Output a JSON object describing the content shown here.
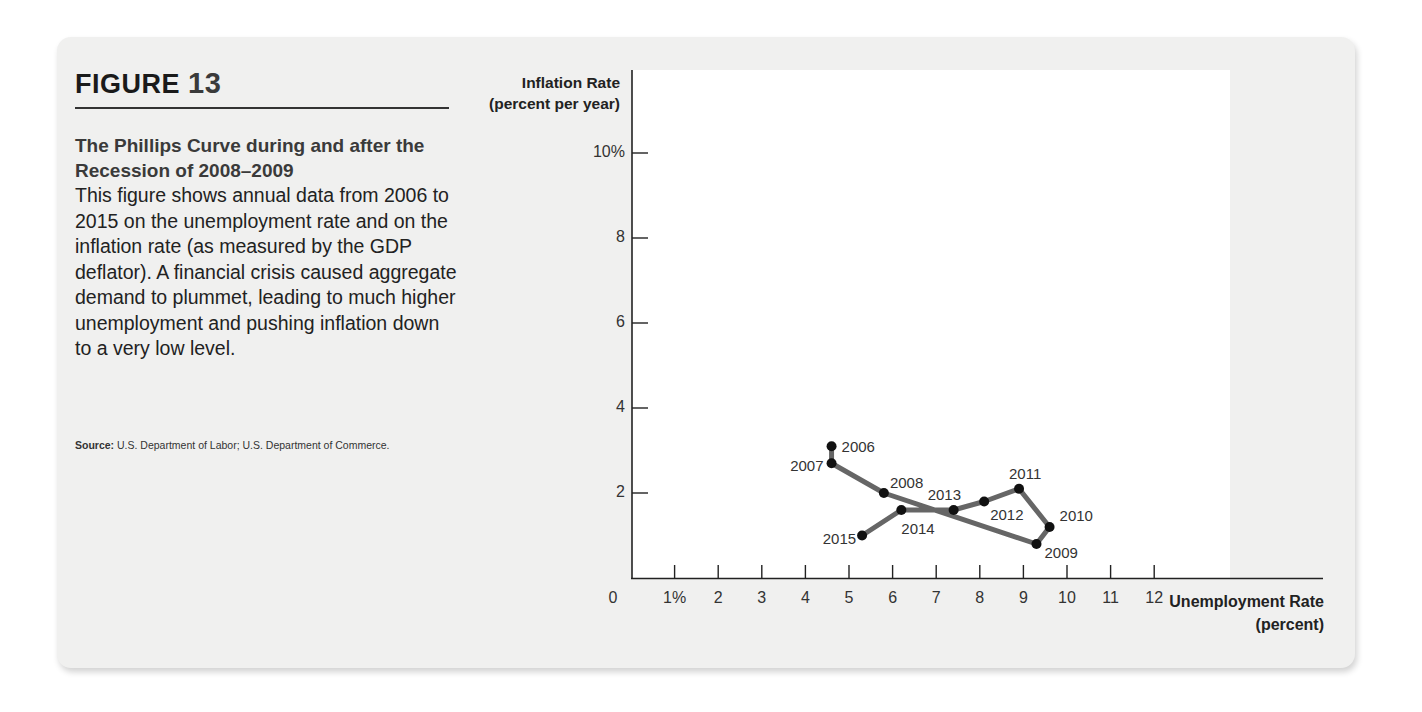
{
  "figure": {
    "label": "FIGURE",
    "number": "13",
    "title": "The Phillips Curve during and after the Recession of 2008–2009",
    "body": "This figure shows annual data from 2006 to 2015 on the unemployment rate and on the inflation rate (as measured by the GDP deflator). A financial crisis caused aggregate demand to plummet, leading to much higher unemployment and pushing inflation down to a very low level.",
    "source_label": "Source:",
    "source_text": "U.S. Department of Labor; U.S. Department of Commerce."
  },
  "colors": {
    "card_bg": "#f0f0ef",
    "line": "#666666",
    "point": "#111111",
    "axis": "#222222"
  },
  "chart_data": {
    "type": "line",
    "title": "The Phillips Curve during and after the Recession of 2008–2009",
    "xlabel": "Unemployment Rate (percent)",
    "ylabel": "Inflation Rate (percent per year)",
    "xlim": [
      0,
      13
    ],
    "ylim": [
      0,
      11
    ],
    "x_ticks": [
      "0",
      "1%",
      "2",
      "3",
      "4",
      "5",
      "6",
      "7",
      "8",
      "9",
      "10",
      "11",
      "12"
    ],
    "y_ticks": [
      "2",
      "4",
      "6",
      "8",
      "10%"
    ],
    "grid": false,
    "legend": null,
    "points": [
      {
        "year": "2006",
        "unemployment": 4.6,
        "inflation": 3.1
      },
      {
        "year": "2007",
        "unemployment": 4.6,
        "inflation": 2.7
      },
      {
        "year": "2008",
        "unemployment": 5.8,
        "inflation": 2.0
      },
      {
        "year": "2009",
        "unemployment": 9.3,
        "inflation": 0.8
      },
      {
        "year": "2010",
        "unemployment": 9.6,
        "inflation": 1.2
      },
      {
        "year": "2011",
        "unemployment": 8.9,
        "inflation": 2.1
      },
      {
        "year": "2012",
        "unemployment": 8.1,
        "inflation": 1.8
      },
      {
        "year": "2013",
        "unemployment": 7.4,
        "inflation": 1.6
      },
      {
        "year": "2014",
        "unemployment": 6.2,
        "inflation": 1.6
      },
      {
        "year": "2015",
        "unemployment": 5.3,
        "inflation": 1.0
      }
    ]
  }
}
